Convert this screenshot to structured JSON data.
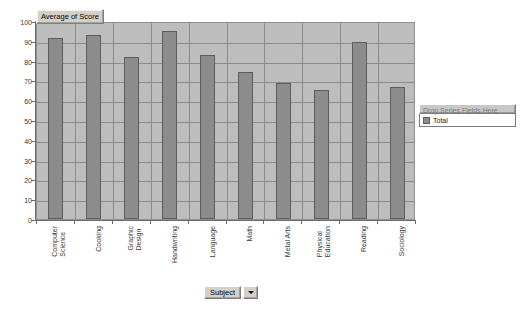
{
  "chart_data": {
    "type": "bar",
    "title": "Average of Score",
    "xlabel": "Subject",
    "ylabel": "",
    "ylim": [
      0,
      100
    ],
    "ytick_step": 10,
    "yticks": [
      "100",
      "90",
      "80",
      "70",
      "60",
      "50",
      "40",
      "30",
      "20",
      "10",
      "0"
    ],
    "grid": true,
    "legend_position": "right",
    "categories": [
      "Computer Science",
      "Cooking",
      "Graphic Design",
      "Handwriting",
      "Language",
      "Math",
      "Metal Arts",
      "Physical Education",
      "Reading",
      "Sociology"
    ],
    "series": [
      {
        "name": "Total",
        "color": "#8c8c8c",
        "values": [
          91.5,
          93.0,
          82.0,
          95.0,
          83.0,
          74.0,
          68.5,
          65.0,
          89.5,
          66.5
        ]
      }
    ]
  },
  "data_field": {
    "label": "Average of Score"
  },
  "category_field": {
    "label": "Subject",
    "dropdown_icon": "chevron-down-icon"
  },
  "legend": {
    "drop_zone_label": "Drop Series Fields Here",
    "items": [
      {
        "label": "Total",
        "color": "#8c8c8c"
      }
    ]
  },
  "colors": {
    "plot_background": "#bdbdbd",
    "bar_fill": "#8c8c8c",
    "bar_border": "#5c5c5c",
    "gridline": "#8b8b8b",
    "axis": "#6b6b6b",
    "page_background": "#ffffff"
  }
}
